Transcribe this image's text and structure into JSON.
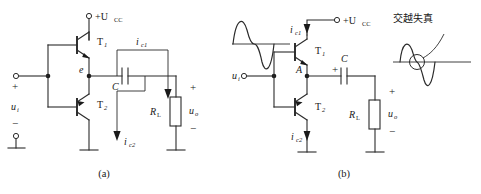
{
  "figure": {
    "panels": [
      {
        "id": "a",
        "caption": "(a)",
        "labels": {
          "supply": "+U",
          "supply_sub": "CC",
          "t1": "T",
          "t1_sub": "1",
          "t2": "T",
          "t2_sub": "2",
          "node_e": "e",
          "cap": "C",
          "rl": "R",
          "rl_sub": "L",
          "uo": "u",
          "uo_sub": "o",
          "ui": "u",
          "ui_sub": "i",
          "ic1": "i",
          "ic1_sub": "c1",
          "ic2": "i",
          "ic2_sub": "c2",
          "plus": "+",
          "minus": "−"
        }
      },
      {
        "id": "b",
        "caption": "(b)",
        "labels": {
          "supply": "+U",
          "supply_sub": "CC",
          "t1": "T",
          "t1_sub": "1",
          "t2": "T",
          "t2_sub": "2",
          "node_a": "A",
          "cap": "C",
          "rl": "R",
          "rl_sub": "L",
          "uo": "u",
          "uo_sub": "o",
          "ui": "u",
          "ui_sub": "i",
          "ic1": "i",
          "ic1_sub": "c1",
          "ic2": "i",
          "ic2_sub": "c2",
          "plus": "+",
          "minus": "−",
          "annotation": "交越失真"
        }
      }
    ]
  },
  "colors": {
    "ink": "#1a1a1a",
    "wire": "#2b2b2b",
    "background": "#ffffff"
  }
}
